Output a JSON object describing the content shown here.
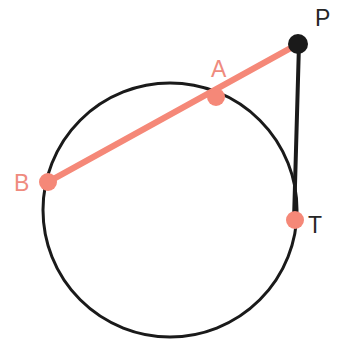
{
  "figure": {
    "width": 346,
    "height": 356,
    "background_color": "#ffffff"
  },
  "colors": {
    "stroke_dark": "#1a1a1a",
    "accent_salmon": "#f58878",
    "label_salmon": "#ef8b7e",
    "label_dark": "#262626",
    "background": "#ffffff"
  },
  "circle": {
    "name": "circle",
    "center_x": 170,
    "center_y": 210,
    "radius": 127,
    "stroke_color": "#1a1a1a",
    "stroke_width": 3,
    "fill": "none"
  },
  "points": [
    {
      "id": "P",
      "label": "P",
      "x": 298,
      "y": 44,
      "dot_radius": 10,
      "dot_color": "#1a1a1a",
      "label_color": "#262626",
      "label_x": 315,
      "label_y": 26,
      "description": "external point"
    },
    {
      "id": "A",
      "label": "A",
      "x": 216,
      "y": 97,
      "dot_radius": 9,
      "dot_color": "#f58878",
      "label_color": "#ef8b7e",
      "label_x": 211,
      "label_y": 77,
      "description": "near secant intersection on circle"
    },
    {
      "id": "B",
      "label": "B",
      "x": 48,
      "y": 182,
      "dot_radius": 9,
      "dot_color": "#f58878",
      "label_color": "#ef8b7e",
      "label_x": 14,
      "label_y": 191,
      "description": "far secant intersection on circle"
    },
    {
      "id": "T",
      "label": "T",
      "x": 295,
      "y": 220,
      "dot_radius": 9,
      "dot_color": "#f58878",
      "label_color": "#262626",
      "label_x": 308,
      "label_y": 233,
      "description": "tangency point on circle"
    }
  ],
  "segments": [
    {
      "id": "secant-PB",
      "name": "secant line from P through A to B",
      "x1": 298,
      "y1": 44,
      "x2": 48,
      "y2": 182,
      "stroke_color": "#f58878",
      "stroke_width": 6
    },
    {
      "id": "tangent-PT",
      "name": "tangent line from P to T",
      "x1": 299,
      "y1": 44,
      "x2": 294,
      "y2": 220,
      "stroke_color": "#1a1a1a",
      "stroke_width": 4
    }
  ]
}
